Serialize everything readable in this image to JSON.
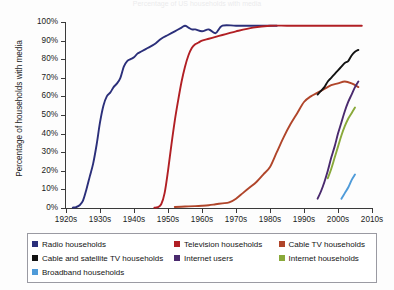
{
  "title": {
    "text": "Percentage of US households with media"
  },
  "axes": {
    "ylabel": "Percentage of households with media",
    "yticks": [
      "0%",
      "10%",
      "20%",
      "30%",
      "40%",
      "50%",
      "60%",
      "70%",
      "80%",
      "90%",
      "100%"
    ],
    "xticks": [
      "1920s",
      "1930s",
      "1940s",
      "1950s",
      "1960s",
      "1970s",
      "1980s",
      "1990s",
      "2000s",
      "2010s"
    ]
  },
  "legend": {
    "rows": [
      [
        {
          "label": "Radio households",
          "color": "#2b2f7a"
        },
        {
          "label": "Television households",
          "color": "#b11f24"
        },
        {
          "label": "Cable TV households",
          "color": "#b0452a"
        }
      ],
      [
        {
          "label": "Cable and satellite TV households",
          "color": "#121212"
        },
        {
          "label": "Internet users",
          "color": "#4a2a6e"
        },
        {
          "label": "Internet households",
          "color": "#89a93a"
        }
      ],
      [
        {
          "label": "Broadband households",
          "color": "#4f9bd9"
        }
      ]
    ]
  },
  "chart_data": {
    "type": "line",
    "title": "Percentage of US households with media",
    "xlabel": "",
    "ylabel": "Percentage of households with media",
    "xlim": [
      1920,
      2010
    ],
    "ylim": [
      0,
      100
    ],
    "grid": false,
    "legend_position": "bottom",
    "x_tick_values": [
      1920,
      1930,
      1940,
      1950,
      1960,
      1970,
      1980,
      1990,
      2000,
      2010
    ],
    "y_tick_values": [
      0,
      10,
      20,
      30,
      40,
      50,
      60,
      70,
      80,
      90,
      100
    ],
    "series": [
      {
        "name": "Radio households",
        "color": "#2b2f7a",
        "x": [
          1922,
          1923,
          1924,
          1925,
          1926,
          1927,
          1928,
          1929,
          1930,
          1931,
          1932,
          1933,
          1934,
          1935,
          1936,
          1937,
          1938,
          1939,
          1940,
          1941,
          1942,
          1944,
          1946,
          1948,
          1950,
          1952,
          1954,
          1955,
          1956,
          1957,
          1958,
          1960,
          1962,
          1964,
          1966,
          1970,
          1975,
          1980,
          1982
        ],
        "y": [
          0.2,
          0.5,
          1.5,
          4,
          10,
          17,
          24,
          34,
          46,
          55,
          60,
          62,
          65,
          67,
          70,
          76,
          79,
          80,
          81,
          83,
          84,
          86,
          88,
          91,
          93,
          95,
          97,
          98,
          97,
          96,
          96,
          95,
          96,
          94,
          98,
          98,
          98,
          98,
          98
        ]
      },
      {
        "name": "Television households",
        "color": "#b11f24",
        "x": [
          1946,
          1947,
          1948,
          1949,
          1950,
          1951,
          1952,
          1953,
          1954,
          1955,
          1956,
          1957,
          1958,
          1959,
          1960,
          1962,
          1964,
          1966,
          1968,
          1970,
          1975,
          1980,
          1985,
          1990,
          1995,
          2000,
          2005,
          2007
        ],
        "y": [
          0.2,
          0.5,
          2,
          8,
          20,
          34,
          47,
          58,
          68,
          76,
          82,
          86,
          88,
          89,
          90,
          91,
          92,
          93,
          94,
          95,
          97,
          98,
          98,
          98,
          98,
          98,
          98,
          98
        ]
      },
      {
        "name": "Cable TV households",
        "color": "#b0452a",
        "x": [
          1952,
          1955,
          1958,
          1960,
          1962,
          1964,
          1966,
          1968,
          1970,
          1972,
          1974,
          1976,
          1978,
          1980,
          1982,
          1984,
          1986,
          1988,
          1990,
          1992,
          1994,
          1996,
          1998,
          2000,
          2002,
          2004,
          2006
        ],
        "y": [
          0.5,
          0.8,
          1,
          1.2,
          1.5,
          2,
          2.5,
          3,
          5,
          8,
          11,
          14,
          18,
          22,
          30,
          38,
          45,
          51,
          57,
          60,
          62,
          64,
          66,
          67,
          68,
          67,
          65
        ]
      },
      {
        "name": "Cable and satellite TV households",
        "color": "#121212",
        "x": [
          1994,
          1995,
          1996,
          1997,
          1998,
          1999,
          2000,
          2001,
          2002,
          2003,
          2004,
          2005,
          2006
        ],
        "y": [
          61,
          63,
          65,
          68,
          70,
          72,
          74,
          76,
          78,
          79,
          82,
          84,
          85
        ]
      },
      {
        "name": "Internet users",
        "color": "#4a2a6e",
        "x": [
          1994,
          1995,
          1996,
          1997,
          1998,
          1999,
          2000,
          2001,
          2002,
          2003,
          2004,
          2005,
          2006
        ],
        "y": [
          5,
          9,
          14,
          20,
          27,
          33,
          40,
          46,
          52,
          57,
          61,
          65,
          68
        ]
      },
      {
        "name": "Internet households",
        "color": "#89a93a",
        "x": [
          1997,
          1998,
          1999,
          2000,
          2001,
          2002,
          2003,
          2004,
          2005
        ],
        "y": [
          16,
          21,
          27,
          33,
          39,
          44,
          48,
          51,
          54
        ]
      },
      {
        "name": "Broadband households",
        "color": "#4f9bd9",
        "x": [
          2001,
          2002,
          2003,
          2004,
          2005
        ],
        "y": [
          5,
          8,
          11,
          15,
          18
        ]
      }
    ]
  }
}
